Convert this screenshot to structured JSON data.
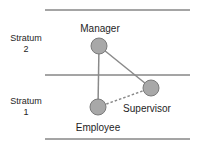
{
  "strata": [
    {
      "name": "stratum-2",
      "line1": "Stratum",
      "line2": "2"
    },
    {
      "name": "stratum-1",
      "line1": "Stratum",
      "line2": "1"
    }
  ],
  "nodes": {
    "manager": {
      "label": "Manager"
    },
    "supervisor": {
      "label": "Supervisor"
    },
    "employee": {
      "label": "Employee"
    }
  },
  "edges": [
    {
      "from": "Manager",
      "to": "Employee",
      "style": "solid"
    },
    {
      "from": "Manager",
      "to": "Supervisor",
      "style": "solid"
    },
    {
      "from": "Supervisor",
      "to": "Employee",
      "style": "dashed"
    }
  ],
  "colors": {
    "node_fill": "#a8a8a8",
    "node_stroke": "#7a7a7a",
    "line": "#8a8a8a",
    "divider": "#4a4a4a",
    "text": "#1e1e1e"
  }
}
